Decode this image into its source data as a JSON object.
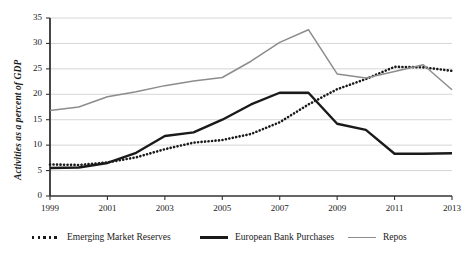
{
  "chart_data": {
    "type": "line",
    "title": "",
    "xlabel": "",
    "ylabel": "Activities as a percent of GDP",
    "xlim": [
      1999,
      2013
    ],
    "ylim": [
      0,
      35
    ],
    "grid": true,
    "grid_axis": "y",
    "legend_position": "bottom",
    "x": [
      1999,
      2000,
      2001,
      2002,
      2003,
      2004,
      2005,
      2006,
      2007,
      2008,
      2009,
      2010,
      2011,
      2012,
      2013
    ],
    "x_ticks": [
      "1999",
      "2001",
      "2003",
      "2005",
      "2007",
      "2009",
      "2011",
      "2013"
    ],
    "x_tick_values": [
      1999,
      2001,
      2003,
      2005,
      2007,
      2009,
      2011,
      2013
    ],
    "y_ticks": [
      "0",
      "5",
      "10",
      "15",
      "20",
      "25",
      "30",
      "35"
    ],
    "y_tick_values": [
      0,
      5,
      10,
      15,
      20,
      25,
      30,
      35
    ],
    "series": [
      {
        "name": "Emerging Market Reserves",
        "style": "dotted",
        "color": "#1a1a1a",
        "values": [
          6.2,
          6.1,
          6.6,
          7.6,
          9.2,
          10.5,
          11.0,
          12.2,
          14.5,
          18.0,
          21.0,
          23.0,
          25.4,
          25.3,
          24.6
        ]
      },
      {
        "name": "European Bank Purchases",
        "style": "solid-thick",
        "color": "#1a1a1a",
        "values": [
          5.5,
          5.6,
          6.5,
          8.5,
          11.8,
          12.5,
          15.0,
          18.0,
          20.3,
          20.3,
          14.2,
          13.0,
          8.3,
          8.3,
          8.4
        ]
      },
      {
        "name": "Repos",
        "style": "solid-gray",
        "color": "#8c8c8c",
        "values": [
          16.8,
          17.5,
          19.5,
          20.5,
          21.7,
          22.6,
          23.3,
          26.5,
          30.2,
          32.7,
          24.0,
          23.0,
          24.5,
          26.0,
          25.0
        ]
      }
    ],
    "repos_values_detail": [
      16.8,
      17.5,
      19.5,
      20.5,
      21.7,
      22.6,
      23.3,
      26.5,
      30.2,
      32.7,
      24.0,
      23.2,
      24.5,
      25.8,
      20.9
    ],
    "colors": {
      "emerging_market_reserves": "#1a1a1a",
      "european_bank_purchases": "#1a1a1a",
      "repos": "#8c8c8c",
      "gridline": "#cccccc",
      "axis": "#333333",
      "background": "#ffffff"
    }
  },
  "axis": {
    "y_title": "Activities as a percent of GDP"
  },
  "legend": {
    "items": [
      {
        "label": "Emerging Market Reserves",
        "style": "dotted",
        "color": "#1a1a1a"
      },
      {
        "label": "European Bank Purchases",
        "style": "solid-thick",
        "color": "#1a1a1a"
      },
      {
        "label": "Repos",
        "style": "solid-gray",
        "color": "#8c8c8c"
      }
    ]
  }
}
